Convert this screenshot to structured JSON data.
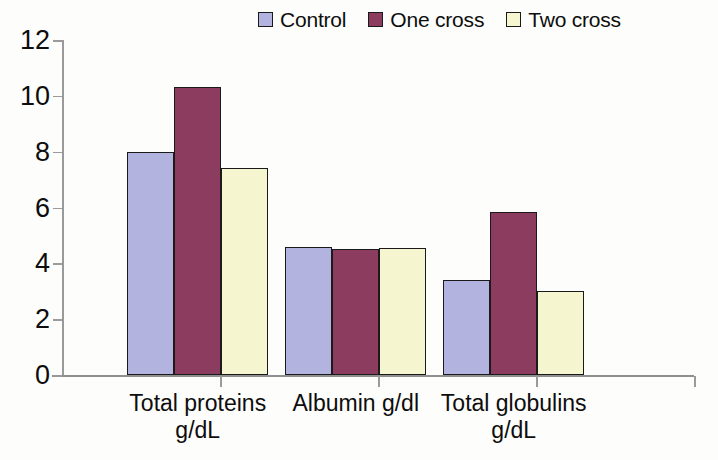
{
  "chart_data": {
    "type": "bar",
    "title": "",
    "subtitle": "",
    "xlabel": "",
    "ylabel": "",
    "categories": [
      "Total proteins\ng/dL",
      "Albumin g/dl",
      "Total globulins\ng/dL"
    ],
    "series": [
      {
        "name": "Control",
        "color": "#b3b3e0",
        "values": [
          8.0,
          4.6,
          3.4
        ]
      },
      {
        "name": "One cross",
        "color": "#8c3c5e",
        "values": [
          10.3,
          4.5,
          5.85
        ]
      },
      {
        "name": "Two cross",
        "color": "#f5f5d0",
        "values": [
          7.4,
          4.55,
          3.0
        ]
      }
    ],
    "ylim": [
      0,
      12
    ],
    "ytick_step": 2,
    "ytick_labels": [
      "12",
      "10",
      "8",
      "6",
      "4",
      "2",
      "0"
    ],
    "grid": false,
    "legend_position": "top-right",
    "bar_border_color": "#1a1a1a",
    "axis_color": "#9a9a9a",
    "background_color": "#fdfdfb"
  },
  "legend": {
    "items": [
      {
        "label": "Control",
        "color": "#b3b3e0"
      },
      {
        "label": "One cross",
        "color": "#8c3c5e"
      },
      {
        "label": "Two cross",
        "color": "#f5f5d0"
      }
    ]
  },
  "axes": {
    "y_ticks": [
      "12",
      "10",
      "8",
      "6",
      "4",
      "2",
      "0"
    ],
    "x_categories": [
      "Total proteins\ng/dL",
      "Albumin g/dl",
      "Total globulins\ng/dL"
    ]
  }
}
